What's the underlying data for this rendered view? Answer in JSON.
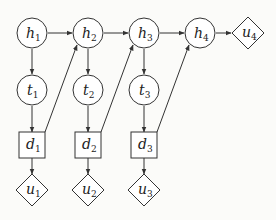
{
  "diagram": {
    "type": "influence-diagram",
    "nodes": {
      "h1": {
        "base": "h",
        "sub": "1",
        "shape": "circle"
      },
      "h2": {
        "base": "h",
        "sub": "2",
        "shape": "circle"
      },
      "h3": {
        "base": "h",
        "sub": "3",
        "shape": "circle"
      },
      "h4": {
        "base": "h",
        "sub": "4",
        "shape": "circle"
      },
      "t1": {
        "base": "t",
        "sub": "1",
        "shape": "circle"
      },
      "t2": {
        "base": "t",
        "sub": "2",
        "shape": "circle"
      },
      "t3": {
        "base": "t",
        "sub": "3",
        "shape": "circle"
      },
      "d1": {
        "base": "d",
        "sub": "1",
        "shape": "square"
      },
      "d2": {
        "base": "d",
        "sub": "2",
        "shape": "square"
      },
      "d3": {
        "base": "d",
        "sub": "3",
        "shape": "square"
      },
      "u1": {
        "base": "u",
        "sub": "1",
        "shape": "diamond"
      },
      "u2": {
        "base": "u",
        "sub": "2",
        "shape": "diamond"
      },
      "u3": {
        "base": "u",
        "sub": "3",
        "shape": "diamond"
      },
      "u4": {
        "base": "u",
        "sub": "4",
        "shape": "diamond"
      }
    },
    "edges": [
      [
        "h1",
        "h2"
      ],
      [
        "h2",
        "h3"
      ],
      [
        "h3",
        "h4"
      ],
      [
        "h4",
        "u4"
      ],
      [
        "h1",
        "t1"
      ],
      [
        "h2",
        "t2"
      ],
      [
        "h3",
        "t3"
      ],
      [
        "t1",
        "d1"
      ],
      [
        "t2",
        "d2"
      ],
      [
        "t3",
        "d3"
      ],
      [
        "d1",
        "u1"
      ],
      [
        "d2",
        "u2"
      ],
      [
        "d3",
        "u3"
      ],
      [
        "d1",
        "h2"
      ],
      [
        "d2",
        "h3"
      ],
      [
        "d3",
        "h4"
      ]
    ]
  }
}
